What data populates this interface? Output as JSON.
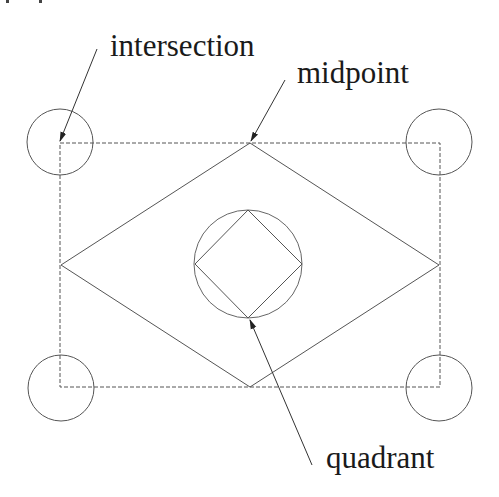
{
  "diagram": {
    "type": "object-snap illustration",
    "labels": {
      "intersection": "intersection",
      "midpoint": "midpoint",
      "quadrant": "quadrant"
    },
    "colors": {
      "line": "#555555",
      "text": "#1a1a1a",
      "background": "#ffffff"
    },
    "rectangle": {
      "x": 60,
      "y": 143,
      "width": 380,
      "height": 244,
      "style": "dashed"
    },
    "diamond": [
      [
        250,
        143
      ],
      [
        439,
        265
      ],
      [
        250,
        387
      ],
      [
        61,
        265
      ]
    ],
    "center_circle": {
      "cx": 248,
      "cy": 264,
      "r": 54
    },
    "inner_square": [
      [
        248,
        210
      ],
      [
        302,
        264
      ],
      [
        248,
        318
      ],
      [
        195,
        264
      ]
    ],
    "corner_circles": [
      {
        "cx": 60,
        "cy": 142,
        "r": 33
      },
      {
        "cx": 440,
        "cy": 142,
        "r": 33
      },
      {
        "cx": 60,
        "cy": 388,
        "r": 33
      },
      {
        "cx": 440,
        "cy": 388,
        "r": 33
      }
    ]
  }
}
